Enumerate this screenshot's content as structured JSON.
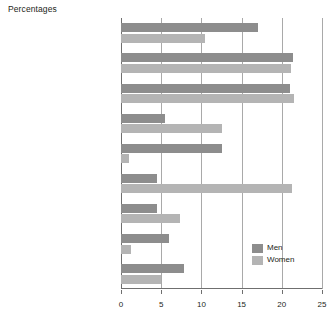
{
  "chart_data": {
    "type": "bar",
    "orientation": "horizontal",
    "title": "Percentages",
    "xlabel": "",
    "ylabel": "",
    "xlim": [
      0,
      25
    ],
    "xticks": [
      0,
      5,
      10,
      15,
      20,
      25
    ],
    "grid": true,
    "legend_position": "bottom-right",
    "categories": [
      "Managers and senior officials",
      "Professional occupations",
      "Associate professional\nand technical",
      "Administrative and secretarial",
      "Skilled trades",
      "Personal service",
      "Sales and customer service",
      "Process, plant and\nmachine operatives",
      "Elementary"
    ],
    "series": [
      {
        "name": "Men",
        "color": "#8d8d8d",
        "values": [
          17.0,
          21.4,
          21.0,
          5.5,
          12.5,
          4.5,
          4.5,
          6.0,
          7.8
        ]
      },
      {
        "name": "Women",
        "color": "#b4b4b4",
        "values": [
          10.5,
          21.2,
          21.5,
          12.5,
          1.0,
          21.3,
          7.3,
          1.2,
          5.0
        ]
      }
    ]
  }
}
